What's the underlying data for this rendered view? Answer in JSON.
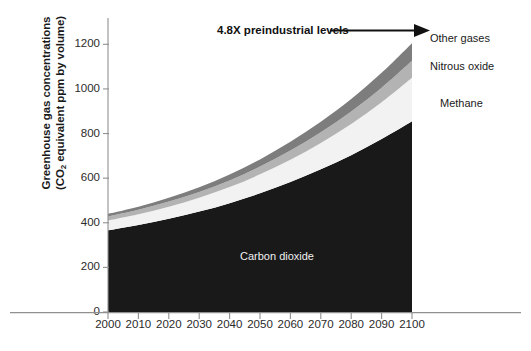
{
  "chart_data": {
    "type": "area",
    "title": "",
    "xlabel": "",
    "ylabel_line1": "Greenhouse gas concentrations",
    "ylabel_line2_pre": "(CO",
    "ylabel_line2_sub": "2",
    "ylabel_line2_post": " equivalent ppm by volume)",
    "stacked": true,
    "grid": false,
    "legend_position": "right-inline",
    "xlim": [
      2000,
      2100
    ],
    "ylim": [
      0,
      1300
    ],
    "yticks": [
      0,
      200,
      400,
      600,
      800,
      1000,
      1200
    ],
    "ytick_labels": [
      "0",
      "200",
      "400",
      "600",
      "800",
      "1000",
      "1200"
    ],
    "x": [
      2000,
      2010,
      2020,
      2030,
      2040,
      2050,
      2060,
      2070,
      2080,
      2090,
      2100
    ],
    "xtick_labels": [
      "2000",
      "2010",
      "2020",
      "2030",
      "2040",
      "2050",
      "2060",
      "2070",
      "2080",
      "2090",
      "2100"
    ],
    "series": [
      {
        "name": "Carbon dioxide",
        "color": "#191919",
        "label_color": "#f0f0f0",
        "values": [
          366,
          390,
          418,
          450,
          488,
          532,
          583,
          640,
          703,
          775,
          855
        ]
      },
      {
        "name": "Methane",
        "color": "#f2f2f2",
        "label_color": "#1a1a1a",
        "values": [
          44,
          48,
          54,
          62,
          72,
          85,
          100,
          118,
          140,
          165,
          195
        ]
      },
      {
        "name": "Nitrous oxide",
        "color": "#b3b3b3",
        "label_color": "#1a1a1a",
        "values": [
          18,
          20,
          23,
          26,
          30,
          35,
          41,
          48,
          56,
          65,
          76
        ]
      },
      {
        "name": "Other gases",
        "color": "#7d7d7d",
        "label_color": "#1a1a1a",
        "values": [
          12,
          14,
          17,
          21,
          26,
          32,
          39,
          47,
          56,
          67,
          79
        ]
      }
    ],
    "totals": [
      440,
      472,
      512,
      559,
      616,
      684,
      763,
      853,
      955,
      1072,
      1205
    ],
    "annotations": [
      {
        "name": "preindustrial-multiplier",
        "text": "4.8X preindustrial levels",
        "arrow": true
      }
    ]
  },
  "legend": {
    "items": [
      {
        "label": "Other gases"
      },
      {
        "label": "Nitrous oxide"
      },
      {
        "label": "Methane"
      },
      {
        "label": "Carbon dioxide"
      }
    ]
  }
}
